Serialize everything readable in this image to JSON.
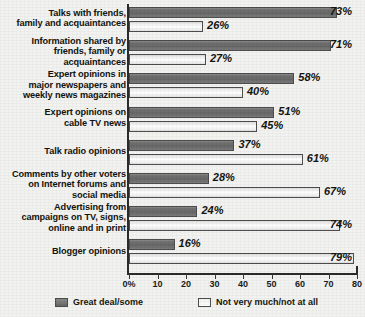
{
  "chart_data": {
    "type": "bar",
    "title": "",
    "xlabel": "",
    "ylabel": "",
    "xlim": [
      0,
      80
    ],
    "grid": false,
    "orientation": "horizontal",
    "legend_position": "bottom",
    "categories": [
      "Talks with friends, family and acquaintances",
      "Information shared by friends, family or acquaintances",
      "Expert opinions in major newspapers and weekly news magazines",
      "Expert opinions on cable TV news",
      "Talk radio opinions",
      "Comments by other voters on Internet forums and social media",
      "Advertising from campaigns on TV, signs, online and in print",
      "Blogger opinions"
    ],
    "category_lines": [
      [
        "Talks with friends,",
        "family and acquaintances"
      ],
      [
        "Information shared by",
        "friends, family or",
        "acquaintances"
      ],
      [
        "Expert opinions in",
        "major newspapers and",
        "weekly news magazines"
      ],
      [
        "Expert opinions on",
        "cable TV news"
      ],
      [
        "Talk radio opinions"
      ],
      [
        "Comments by other voters",
        "on Internet forums and",
        "social media"
      ],
      [
        "Advertising from",
        "campaigns on TV, signs,",
        "online and in print"
      ],
      [
        "Blogger opinions"
      ]
    ],
    "series": [
      {
        "name": "Great deal/some",
        "color": "#6f6f6f",
        "values": [
          73,
          71,
          58,
          51,
          37,
          28,
          24,
          16
        ],
        "labels": [
          "73%",
          "71%",
          "58%",
          "51%",
          "37%",
          "28%",
          "24%",
          "16%"
        ]
      },
      {
        "name": "Not very much/not at all",
        "color": "#f4f4f4",
        "values": [
          26,
          27,
          40,
          45,
          61,
          67,
          74,
          79
        ],
        "labels": [
          "26%",
          "27%",
          "40%",
          "45%",
          "61%",
          "67%",
          "74%",
          "79%"
        ]
      }
    ],
    "xticks": [
      0,
      10,
      20,
      30,
      40,
      50,
      60,
      70,
      80
    ],
    "xtick_labels": [
      "0%",
      "10",
      "20",
      "30",
      "40",
      "50",
      "60",
      "70",
      "80"
    ]
  },
  "legend": {
    "items": [
      {
        "label": "Great deal/some",
        "swatch": "dark"
      },
      {
        "label": "Not very much/not at all",
        "swatch": "light"
      }
    ]
  }
}
